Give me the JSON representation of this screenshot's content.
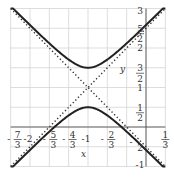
{
  "chart_data": {
    "type": "line",
    "title": "",
    "xlabel": "x",
    "ylabel": "y",
    "xlim": [
      -2.3333,
      0.3333
    ],
    "ylim": [
      -1,
      3
    ],
    "grid": true,
    "x_ticks": [
      {
        "value": -2.3333,
        "label": "-7/3",
        "num": "7",
        "den": "3",
        "neg": true
      },
      {
        "value": -2,
        "label": "-2",
        "num": "-2",
        "den": "",
        "neg": false
      },
      {
        "value": -1.6667,
        "label": "-5/3",
        "num": "5",
        "den": "3",
        "neg": true
      },
      {
        "value": -1.3333,
        "label": "-4/3",
        "num": "4",
        "den": "3",
        "neg": true
      },
      {
        "value": -1,
        "label": "-1",
        "num": "-1",
        "den": "",
        "neg": false
      },
      {
        "value": -0.6667,
        "label": "-2/3",
        "num": "2",
        "den": "3",
        "neg": true
      },
      {
        "value": 0.3333,
        "label": "1/3",
        "num": "1",
        "den": "3",
        "neg": false
      }
    ],
    "y_ticks": [
      {
        "value": 3,
        "label": "3",
        "num": "3",
        "den": ""
      },
      {
        "value": 2.5,
        "label": "5/2",
        "num": "5",
        "den": "2"
      },
      {
        "value": 2,
        "label": "2",
        "num": "2",
        "den": ""
      },
      {
        "value": 1.5,
        "label": "3/2",
        "num": "3",
        "den": "2"
      },
      {
        "value": 1,
        "label": "1",
        "num": "1",
        "den": ""
      },
      {
        "value": 0.5,
        "label": "1/2",
        "num": "1",
        "den": "2"
      },
      {
        "value": -0.5,
        "label": "-1/2",
        "num": "2",
        "den": "",
        "neg": true
      },
      {
        "value": -1,
        "label": "-1",
        "num": "-1",
        "den": ""
      }
    ],
    "series": [
      {
        "name": "hyperbola upper branch",
        "style": "solid",
        "equation": "y = 1 + 0.5*sqrt(1 + 9(x+1)^2)",
        "vertex": [
          -1,
          1.5
        ]
      },
      {
        "name": "hyperbola lower branch",
        "style": "solid",
        "equation": "y = 1 - 0.5*sqrt(1 + 9(x+1)^2)",
        "vertex": [
          -1,
          0.5
        ]
      },
      {
        "name": "asymptote 1",
        "style": "dotted",
        "equation": "y = 1 + 1.5(x+1)"
      },
      {
        "name": "asymptote 2",
        "style": "dotted",
        "equation": "y = 1 - 1.5(x+1)"
      }
    ],
    "center": [
      -1,
      1
    ],
    "grid_step_x": 0.3333,
    "grid_step_y": 0.5
  },
  "labels": {
    "x_axis": "x",
    "y_axis": "y"
  }
}
